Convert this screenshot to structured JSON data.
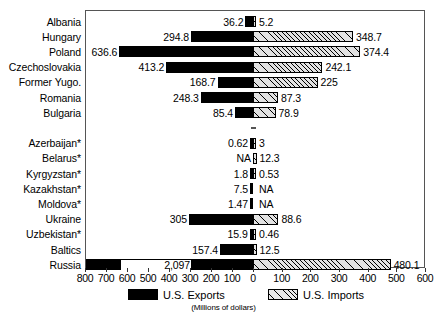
{
  "chart_data": {
    "type": "bar",
    "orientation": "horizontal",
    "style": "diverging-bidirectional",
    "title": "",
    "subtitle": "(Millions of dollars)",
    "xlabel": "",
    "ylabel": "",
    "units": "Millions of dollars",
    "grid": false,
    "legend_position": "bottom",
    "axis": {
      "tick_labels": [
        "800",
        "700",
        "600",
        "500",
        "400",
        "300",
        "200",
        "100",
        "0",
        "100",
        "200",
        "300",
        "400",
        "500",
        "600"
      ],
      "tick_values": [
        -800,
        -700,
        -600,
        -500,
        -400,
        -300,
        -200,
        -100,
        0,
        100,
        200,
        300,
        400,
        500,
        600
      ],
      "left_max": 800,
      "right_max": 600,
      "zero_label": "0"
    },
    "series": [
      {
        "name": "U.S. Exports",
        "direction": "left",
        "fill": "solid-black"
      },
      {
        "name": "U.S. Imports",
        "direction": "right",
        "fill": "diagonal-hatch"
      }
    ],
    "categories": [
      "Albania",
      "Hungary",
      "Poland",
      "Czechoslovakia",
      "Former Yugo.",
      "Romania",
      "Bulgaria",
      "",
      "Azerbaijan*",
      "Belarus*",
      "Kyrgyzstan*",
      "Kazakhstan*",
      "Moldova*",
      "Ukraine",
      "Uzbekistan*",
      "Baltics",
      "Russia"
    ],
    "rows": [
      {
        "label": "Albania",
        "export_label": "36.2",
        "export_value": 36.2,
        "import_label": "5.2",
        "import_value": 5.2,
        "spacer": false,
        "clipped": false
      },
      {
        "label": "Hungary",
        "export_label": "294.8",
        "export_value": 294.8,
        "import_label": "348.7",
        "import_value": 348.7,
        "spacer": false,
        "clipped": false
      },
      {
        "label": "Poland",
        "export_label": "636.6",
        "export_value": 636.6,
        "import_label": "374.4",
        "import_value": 374.4,
        "spacer": false,
        "clipped": false
      },
      {
        "label": "Czechoslovakia",
        "export_label": "413.2",
        "export_value": 413.2,
        "import_label": "242.1",
        "import_value": 242.1,
        "spacer": false,
        "clipped": false
      },
      {
        "label": "Former Yugo.",
        "export_label": "168.7",
        "export_value": 168.7,
        "import_label": "225",
        "import_value": 225,
        "spacer": false,
        "clipped": false
      },
      {
        "label": "Romania",
        "export_label": "248.3",
        "export_value": 248.3,
        "import_label": "87.3",
        "import_value": 87.3,
        "spacer": false,
        "clipped": false
      },
      {
        "label": "Bulgaria",
        "export_label": "85.4",
        "export_value": 85.4,
        "import_label": "78.9",
        "import_value": 78.9,
        "spacer": false,
        "clipped": false
      },
      {
        "label": "",
        "export_label": "",
        "export_value": 0,
        "import_label": "",
        "import_value": 0,
        "spacer": true,
        "clipped": false
      },
      {
        "label": "Azerbaijan*",
        "export_label": "0.62",
        "export_value": 0.62,
        "import_label": "3",
        "import_value": 3,
        "spacer": false,
        "clipped": false
      },
      {
        "label": "Belarus*",
        "export_label": "NA",
        "export_value": 0,
        "import_label": "12.3",
        "import_value": 12.3,
        "spacer": false,
        "clipped": false
      },
      {
        "label": "Kyrgyzstan*",
        "export_label": "1.8",
        "export_value": 1.8,
        "import_label": "0.53",
        "import_value": 0.53,
        "spacer": false,
        "clipped": false
      },
      {
        "label": "Kazakhstan*",
        "export_label": "7.5",
        "export_value": 7.5,
        "import_label": "NA",
        "import_value": 0,
        "spacer": false,
        "clipped": false
      },
      {
        "label": "Moldova*",
        "export_label": "1.47",
        "export_value": 1.47,
        "import_label": "NA",
        "import_value": 0,
        "spacer": false,
        "clipped": false
      },
      {
        "label": "Ukraine",
        "export_label": "305",
        "export_value": 305,
        "import_label": "88.6",
        "import_value": 88.6,
        "spacer": false,
        "clipped": false
      },
      {
        "label": "Uzbekistan*",
        "export_label": "15.9",
        "export_value": 15.9,
        "import_label": "0.46",
        "import_value": 0.46,
        "spacer": false,
        "clipped": false
      },
      {
        "label": "Baltics",
        "export_label": "157.4",
        "export_value": 157.4,
        "import_label": "12.5",
        "import_value": 12.5,
        "spacer": false,
        "clipped": false
      },
      {
        "label": "Russia",
        "export_label": "2,097",
        "export_value": 2097,
        "import_label": "480.1",
        "import_value": 480.1,
        "spacer": false,
        "clipped": true
      }
    ]
  },
  "legend": {
    "exports_label": "U.S. Exports",
    "imports_label": "U.S. Imports"
  },
  "footnote": {
    "units_text": "(Millions of dollars)"
  }
}
